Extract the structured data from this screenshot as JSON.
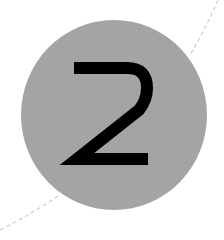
{
  "badge": {
    "number": "2",
    "fill_color": "#a4a4a4",
    "text_color": "#000000"
  },
  "decoration": {
    "arc_style": "dashed",
    "arc_color": "#d0d0d0"
  }
}
